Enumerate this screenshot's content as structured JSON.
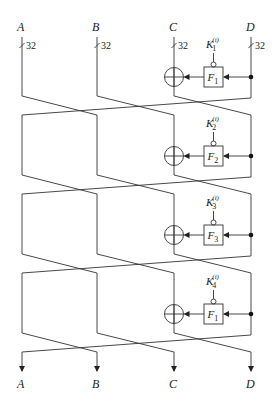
{
  "diagram": {
    "type": "feistel-network",
    "inputs": [
      {
        "label": "A",
        "bits": "32"
      },
      {
        "label": "B",
        "bits": "32"
      },
      {
        "label": "C",
        "bits": "32"
      },
      {
        "label": "D",
        "bits": "32"
      }
    ],
    "outputs": [
      {
        "label": "A"
      },
      {
        "label": "B"
      },
      {
        "label": "C"
      },
      {
        "label": "D"
      }
    ],
    "rounds": [
      {
        "key": "K",
        "key_sub": "1",
        "key_sup": "(i)",
        "func": "F",
        "func_sub": "1"
      },
      {
        "key": "K",
        "key_sub": "2",
        "key_sup": "(i)",
        "func": "F",
        "func_sub": "2"
      },
      {
        "key": "K",
        "key_sub": "3",
        "key_sup": "(i)",
        "func": "F",
        "func_sub": "3"
      },
      {
        "key": "K",
        "key_sub": "4",
        "key_sup": "(i)",
        "func": "F",
        "func_sub": "1"
      }
    ],
    "colors": {
      "line": "#333333",
      "text": "#222222",
      "background": "#ffffff"
    }
  }
}
